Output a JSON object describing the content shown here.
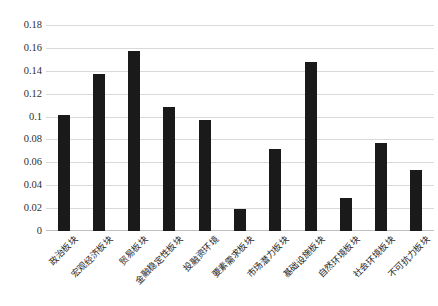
{
  "chart_data": {
    "type": "bar",
    "title": "",
    "subtitle": "",
    "xlabel": "",
    "ylabel": "",
    "ylim": [
      0,
      0.18
    ],
    "grid": true,
    "legend": false,
    "bar_color": "#1a1a1a",
    "gridline_color": "#d9d9d9",
    "yticks": [
      "0",
      "0.02",
      "0.04",
      "0.06",
      "0.08",
      "0.1",
      "0.12",
      "0.14",
      "0.16",
      "0.18"
    ],
    "ytick_values": [
      0,
      0.02,
      0.04,
      0.06,
      0.08,
      0.1,
      0.12,
      0.14,
      0.16,
      0.18
    ],
    "categories": [
      "政治板块",
      "宏观经济板块",
      "贸易板块",
      "金融稳定性板块",
      "投融资环境",
      "要素需求板块",
      "市场潜力板块",
      "基础设施板块",
      "自然环境板块",
      "社会环境板块",
      "不可抗力板块"
    ],
    "values": [
      0.101,
      0.137,
      0.157,
      0.108,
      0.097,
      0.019,
      0.072,
      0.148,
      0.029,
      0.077,
      0.053
    ],
    "series": [
      {
        "name": "权重",
        "values": [
          0.101,
          0.137,
          0.157,
          0.108,
          0.097,
          0.019,
          0.072,
          0.148,
          0.029,
          0.077,
          0.053
        ]
      }
    ]
  },
  "caption": {
    "text": ""
  }
}
